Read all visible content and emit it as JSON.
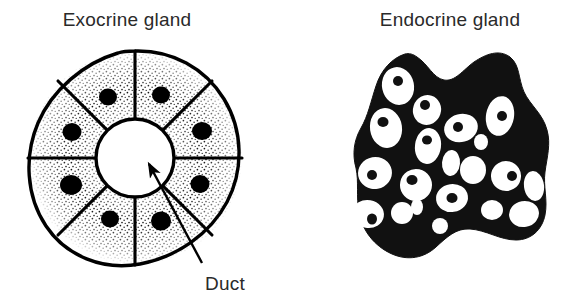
{
  "figure": {
    "type": "biological-diagram",
    "background_color": "#ffffff",
    "ink_color": "#000000",
    "text_color": "#2a2a2a",
    "width": 570,
    "height": 305,
    "panels": [
      {
        "id": "exocrine",
        "title": "Exocrine gland",
        "title_x": 127,
        "title_y": 26,
        "description": "Circular acinus of wedge-shaped secretory cells surrounding a central duct lumen",
        "center_x": 135,
        "center_y": 158,
        "outer_radius": 107,
        "lumen_radius": 39,
        "cell_count": 8,
        "cells": [
          {
            "index": 0,
            "angle_start": -90,
            "angle_end": -45,
            "nucleus_angle": -67,
            "nucleus_radius": 68,
            "nucleus_rx": 9,
            "nucleus_ry": 8.5
          },
          {
            "index": 1,
            "angle_start": -45,
            "angle_end": 0,
            "nucleus_angle": -22,
            "nucleus_radius": 72,
            "nucleus_rx": 10,
            "nucleus_ry": 9
          },
          {
            "index": 2,
            "angle_start": 0,
            "angle_end": 45,
            "nucleus_angle": 22,
            "nucleus_radius": 70,
            "nucleus_rx": 9.5,
            "nucleus_ry": 9
          },
          {
            "index": 3,
            "angle_start": 45,
            "angle_end": 90,
            "nucleus_angle": 67,
            "nucleus_radius": 68,
            "nucleus_rx": 10,
            "nucleus_ry": 9.5
          },
          {
            "index": 4,
            "angle_start": 90,
            "angle_end": 135,
            "nucleus_angle": 112,
            "nucleus_radius": 66,
            "nucleus_rx": 9,
            "nucleus_ry": 8.5
          },
          {
            "index": 5,
            "angle_start": 135,
            "angle_end": 180,
            "nucleus_angle": 157,
            "nucleus_radius": 70,
            "nucleus_rx": 11,
            "nucleus_ry": 10
          },
          {
            "index": 6,
            "angle_start": 180,
            "angle_end": 225,
            "nucleus_angle": 202,
            "nucleus_radius": 68,
            "nucleus_rx": 9.5,
            "nucleus_ry": 9
          },
          {
            "index": 7,
            "angle_start": 225,
            "angle_end": 270,
            "nucleus_angle": 247,
            "nucleus_radius": 70,
            "nucleus_rx": 9,
            "nucleus_ry": 8.5
          }
        ],
        "callout": {
          "label": "Duct",
          "label_x": 205,
          "label_y": 290,
          "arrow_tail_x": 202,
          "arrow_tail_y": 263,
          "arrow_tip_x": 149,
          "arrow_tip_y": 164
        }
      },
      {
        "id": "endocrine",
        "title": "Endocrine gland",
        "title_x": 450,
        "title_y": 26,
        "description": "Irregular cord-like mass of secretory cells with no duct",
        "outline_path": "M 405 54 C 392 58 381 70 376 86 C 371 101 368 116 361 128 C 354 140 352 154 356 168 C 359 182 356 196 359 212 C 362 230 374 246 392 254 C 408 261 424 258 436 247 C 447 237 456 228 470 229 C 486 230 500 240 516 240 C 531 240 542 230 545 215 C 548 200 543 186 545 172 C 547 157 551 144 547 130 C 543 114 530 105 524 92 C 518 78 520 65 510 57 C 499 49 486 54 474 62 C 463 70 455 82 444 80 C 433 78 428 64 417 57 C 413 54 409 53 405 54 Z",
        "cells": [
          {
            "cx": 398,
            "cy": 86,
            "rx": 16,
            "ry": 19,
            "rot": -12,
            "nucleus": {
              "cx": 398,
              "cy": 81,
              "rx": 5,
              "ry": 5
            }
          },
          {
            "cx": 427,
            "cy": 110,
            "rx": 14,
            "ry": 15,
            "rot": 18,
            "nucleus": {
              "cx": 425,
              "cy": 105,
              "rx": 5,
              "ry": 5
            }
          },
          {
            "cx": 386,
            "cy": 128,
            "rx": 16,
            "ry": 20,
            "rot": -8,
            "nucleus": {
              "cx": 383,
              "cy": 122,
              "rx": 5.5,
              "ry": 5
            }
          },
          {
            "cx": 428,
            "cy": 146,
            "rx": 13,
            "ry": 18,
            "rot": 8,
            "nucleus": {
              "cx": 427,
              "cy": 140,
              "rx": 5,
              "ry": 4.5
            }
          },
          {
            "cx": 461,
            "cy": 128,
            "rx": 17,
            "ry": 14,
            "rot": -15,
            "nucleus": {
              "cx": 458,
              "cy": 127,
              "rx": 5,
              "ry": 5
            }
          },
          {
            "cx": 500,
            "cy": 116,
            "rx": 14,
            "ry": 20,
            "rot": 10,
            "nucleus": {
              "cx": 502,
              "cy": 116,
              "rx": 5,
              "ry": 5
            }
          },
          {
            "cx": 481,
            "cy": 142,
            "rx": 7,
            "ry": 8,
            "rot": 0,
            "nucleus": null
          },
          {
            "cx": 451,
            "cy": 163,
            "rx": 9,
            "ry": 13,
            "rot": 5,
            "nucleus": null
          },
          {
            "cx": 473,
            "cy": 170,
            "rx": 13,
            "ry": 14,
            "rot": 0,
            "nucleus": null
          },
          {
            "cx": 375,
            "cy": 173,
            "rx": 17,
            "ry": 16,
            "rot": -10,
            "nucleus": {
              "cx": 372,
              "cy": 175,
              "rx": 5,
              "ry": 5
            }
          },
          {
            "cx": 416,
            "cy": 185,
            "rx": 16,
            "ry": 16,
            "rot": 12,
            "nucleus": {
              "cx": 412,
              "cy": 180,
              "rx": 5.5,
              "ry": 5
            }
          },
          {
            "cx": 452,
            "cy": 198,
            "rx": 16,
            "ry": 14,
            "rot": -8,
            "nucleus": {
              "cx": 452,
              "cy": 198,
              "rx": 5.5,
              "ry": 5
            }
          },
          {
            "cx": 506,
            "cy": 176,
            "rx": 15,
            "ry": 15,
            "rot": 14,
            "nucleus": {
              "cx": 512,
              "cy": 176,
              "rx": 5,
              "ry": 5
            }
          },
          {
            "cx": 534,
            "cy": 186,
            "rx": 10,
            "ry": 15,
            "rot": -8,
            "nucleus": null
          },
          {
            "cx": 368,
            "cy": 214,
            "rx": 16,
            "ry": 14,
            "rot": 10,
            "nucleus": {
              "cx": 372,
              "cy": 219,
              "rx": 5,
              "ry": 5.5
            }
          },
          {
            "cx": 402,
            "cy": 213,
            "rx": 11,
            "ry": 11,
            "rot": 0,
            "nucleus": null
          },
          {
            "cx": 417,
            "cy": 207,
            "rx": 6,
            "ry": 8,
            "rot": 0,
            "nucleus": null
          },
          {
            "cx": 492,
            "cy": 210,
            "rx": 11,
            "ry": 10,
            "rot": 0,
            "nucleus": null
          },
          {
            "cx": 524,
            "cy": 214,
            "rx": 15,
            "ry": 13,
            "rot": -10,
            "nucleus": null
          },
          {
            "cx": 440,
            "cy": 226,
            "rx": 8,
            "ry": 8,
            "rot": 0,
            "nucleus": null
          }
        ]
      }
    ]
  }
}
